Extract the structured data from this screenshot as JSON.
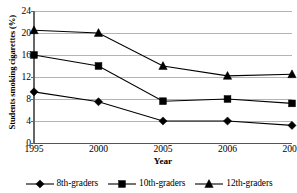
{
  "chart_data": {
    "type": "line",
    "title": "",
    "xlabel": "Year",
    "ylabel": "Students smoking cigarettes (%)",
    "categories": [
      "1995",
      "2000",
      "2005",
      "2006",
      "2007"
    ],
    "ylim": [
      0,
      24
    ],
    "yticks": [
      0,
      4,
      8,
      12,
      16,
      20,
      24
    ],
    "ytick_labels": [
      "0",
      "4",
      "8",
      "12",
      "16",
      "20",
      "24"
    ],
    "grid": "horizontal",
    "grid_color": "#b3b3b3",
    "legend_position": "bottom",
    "series": [
      {
        "name": "8th-graders",
        "marker": "diamond",
        "color": "#000000",
        "values": [
          9.3,
          7.5,
          4.0,
          4.0,
          3.2
        ]
      },
      {
        "name": "10th-graders",
        "marker": "square",
        "color": "#000000",
        "values": [
          16.0,
          14.0,
          7.6,
          8.0,
          7.2
        ]
      },
      {
        "name": "12th-graders",
        "marker": "triangle",
        "color": "#000000",
        "values": [
          20.5,
          20.0,
          14.0,
          12.2,
          12.5
        ]
      }
    ]
  },
  "axis": {
    "y_title": "Students smoking cigarettes (%)",
    "x_title": "Year"
  },
  "legend": {
    "items": [
      {
        "label": "8th-graders",
        "marker": "diamond-marker-icon"
      },
      {
        "label": "10th-graders",
        "marker": "square-marker-icon"
      },
      {
        "label": "12th-graders",
        "marker": "triangle-marker-icon"
      }
    ]
  }
}
